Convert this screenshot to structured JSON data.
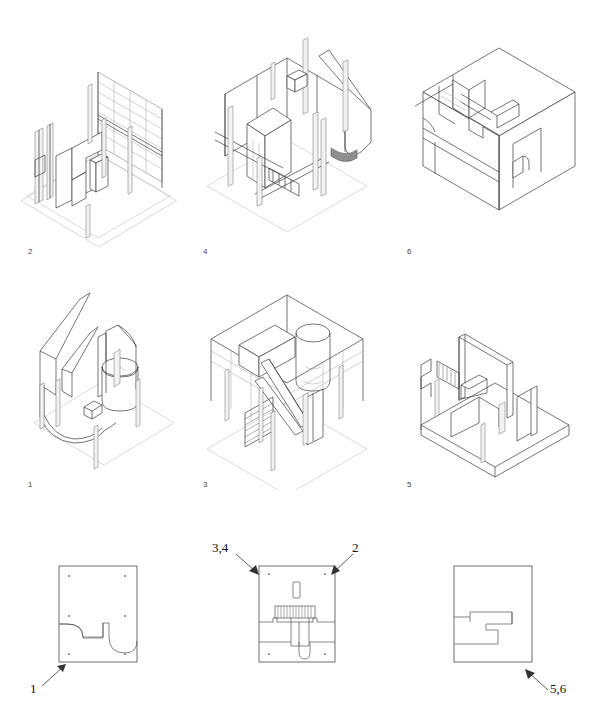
{
  "sheet": {
    "title": "Axonometric exploded views and floor plans",
    "background_color": "#ffffff",
    "line_color": "#3b3b3b",
    "width": 595,
    "height": 727
  },
  "axonometrics": [
    {
      "id": "axo-2",
      "label": "2",
      "row": "top",
      "column": "left",
      "description": "Interior axonometric with glazed grid wall and free-form partition"
    },
    {
      "id": "axo-4",
      "label": "4",
      "row": "top",
      "column": "center",
      "description": "Interior axonometric with columns, stair and curved screen"
    },
    {
      "id": "axo-6",
      "label": "6",
      "row": "top",
      "column": "right",
      "description": "Solid massing axonometric with roof slab cut away"
    },
    {
      "id": "axo-1",
      "label": "1",
      "row": "middle",
      "column": "left",
      "description": "Axonometric of curved partition and cylinder volume"
    },
    {
      "id": "axo-3",
      "label": "3",
      "row": "middle",
      "column": "center",
      "description": "Axonometric of open plan with stair and cylindrical core"
    },
    {
      "id": "axo-5",
      "label": "5",
      "row": "middle",
      "column": "right",
      "description": "Axonometric of walled floor plate with stair hatch"
    }
  ],
  "plans": [
    {
      "id": "plan-left",
      "description": "Ground floor plan with curved recess",
      "corner_dots": 6
    },
    {
      "id": "plan-center",
      "description": "Floor plan with stair run, shaft and rounded end wall",
      "corner_dots": 4
    },
    {
      "id": "plan-right",
      "description": "Floor plan with stepped interlocking partition",
      "corner_dots": 0
    }
  ],
  "callouts": [
    {
      "id": "callout-1",
      "label": "1",
      "direction": "up-right",
      "target": "plan-left"
    },
    {
      "id": "callout-34",
      "label": "3,4",
      "direction": "down-right",
      "target": "plan-center"
    },
    {
      "id": "callout-2",
      "label": "2",
      "direction": "down-left",
      "target": "plan-center"
    },
    {
      "id": "callout-56",
      "label": "5,6",
      "direction": "up-left",
      "target": "plan-right"
    }
  ]
}
